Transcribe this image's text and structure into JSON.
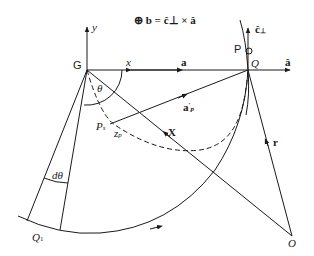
{
  "diagram": {
    "equation": "⊕ b = ĉ⊥ × â",
    "points": {
      "G": {
        "label": "G",
        "x": 87,
        "y": 70
      },
      "Q": {
        "label": "Q",
        "x": 248,
        "y": 70
      },
      "O": {
        "label": "O",
        "x": 292,
        "y": 236
      },
      "Q1": {
        "label": "Q",
        "sub": "1",
        "x": 30,
        "y": 218
      },
      "P": {
        "label": "P",
        "x": 248,
        "y": 51
      },
      "Ps": {
        "label": "P",
        "sub": "s",
        "x": 109,
        "y": 121
      }
    },
    "labels": {
      "y_axis": "y",
      "x_axis": "x",
      "theta": "θ",
      "d_theta": "dθ",
      "a": "a",
      "a_hat": "â",
      "c_perp": "ĉ",
      "c_perp_sub": "⊥",
      "a_p": "a",
      "a_p_sup": "′",
      "a_p_sub": "p",
      "z_p": "z",
      "z_p_sub": "p",
      "X": "X",
      "r": "r"
    },
    "colors": {
      "stroke": "#1a1a1a",
      "background": "#ffffff"
    }
  }
}
